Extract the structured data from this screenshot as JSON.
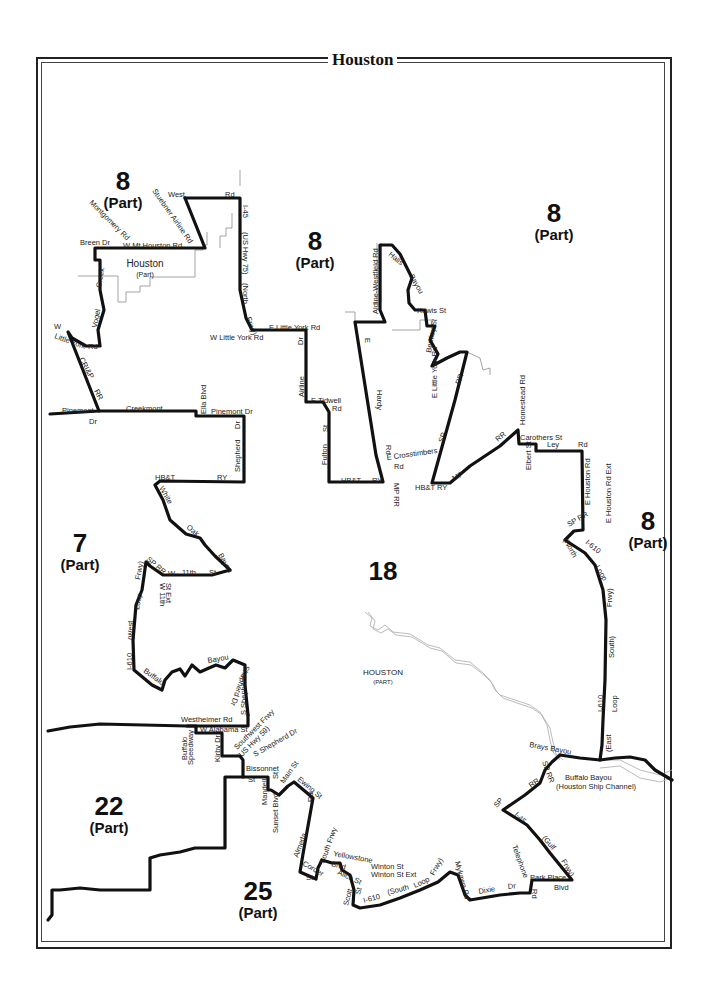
{
  "map": {
    "title": "Houston",
    "districts": [
      {
        "id": "8-nw",
        "number": "8",
        "part": "(Part)",
        "x": 123,
        "y": 190
      },
      {
        "id": "8-n",
        "number": "8",
        "part": "(Part)",
        "x": 315,
        "y": 250
      },
      {
        "id": "8-ne",
        "number": "8",
        "part": "(Part)",
        "x": 554,
        "y": 222
      },
      {
        "id": "8-e",
        "number": "8",
        "part": "(Part)",
        "x": 648,
        "y": 530
      },
      {
        "id": "7",
        "number": "7",
        "part": "(Part)",
        "x": 80,
        "y": 552
      },
      {
        "id": "18",
        "number": "18",
        "part": "",
        "x": 383,
        "y": 580
      },
      {
        "id": "22",
        "number": "22",
        "part": "(Part)",
        "x": 109,
        "y": 815
      },
      {
        "id": "25",
        "number": "25",
        "part": "(Part)",
        "x": 258,
        "y": 900
      }
    ],
    "cities": [
      {
        "id": "houston-nw",
        "name": "Houston",
        "sub": "(Part)",
        "x": 145,
        "y": 267
      },
      {
        "id": "houston-central",
        "name": "HOUSTON",
        "sub": "(PART)",
        "x": 383,
        "y": 675
      }
    ],
    "labels": [
      {
        "t": "West",
        "x": 168,
        "y": 197,
        "r": 0
      },
      {
        "t": "Rd",
        "x": 225,
        "y": 197,
        "r": 0
      },
      {
        "t": "Stuebner Airline Rd",
        "x": 152,
        "y": 191,
        "r": 55
      },
      {
        "t": "Montgomery Rd",
        "x": 89,
        "y": 203,
        "r": 45
      },
      {
        "t": "Breen Dr",
        "x": 80,
        "y": 245,
        "r": 0
      },
      {
        "t": "W Mt Houston Rd",
        "x": 123,
        "y": 248,
        "r": 0
      },
      {
        "t": "I-45",
        "x": 243,
        "y": 205,
        "r": 90
      },
      {
        "t": "(US Hwy 75)",
        "x": 243,
        "y": 232,
        "r": 90
      },
      {
        "t": "(North",
        "x": 243,
        "y": 283,
        "r": 90
      },
      {
        "t": "Frwy)",
        "x": 246,
        "y": 318,
        "r": 70
      },
      {
        "t": "Creek",
        "x": 101,
        "y": 288,
        "r": -80
      },
      {
        "t": "Vogel",
        "x": 97,
        "y": 328,
        "r": -80
      },
      {
        "t": "W",
        "x": 54,
        "y": 329,
        "r": 0
      },
      {
        "t": "Little York",
        "x": 54,
        "y": 338,
        "r": 20
      },
      {
        "t": "Rd",
        "x": 88,
        "y": 349,
        "r": 0
      },
      {
        "t": "CRI&P",
        "x": 79,
        "y": 359,
        "r": 62
      },
      {
        "t": "RR",
        "x": 94,
        "y": 391,
        "r": 62
      },
      {
        "t": "E  Little York Rd",
        "x": 269,
        "y": 330,
        "r": 0
      },
      {
        "t": "W Little York Rd",
        "x": 210,
        "y": 340,
        "r": 0
      },
      {
        "t": "Dr",
        "x": 303,
        "y": 345,
        "r": -90
      },
      {
        "t": "Airline",
        "x": 304,
        "y": 397,
        "r": -90
      },
      {
        "t": "E Tidwell",
        "x": 311,
        "y": 403,
        "r": 0
      },
      {
        "t": "Rd",
        "x": 332,
        "y": 411,
        "r": 0
      },
      {
        "t": "St",
        "x": 328,
        "y": 432,
        "r": -90
      },
      {
        "t": "Fulton",
        "x": 327,
        "y": 465,
        "r": -90
      },
      {
        "t": "Pinemont",
        "x": 62,
        "y": 413,
        "r": 0
      },
      {
        "t": "Dr",
        "x": 89,
        "y": 424,
        "r": 0
      },
      {
        "t": "Creekmont",
        "x": 126,
        "y": 411,
        "r": 0
      },
      {
        "t": "Ella Blvd",
        "x": 206,
        "y": 414,
        "r": -90
      },
      {
        "t": "Pinemont Dr",
        "x": 211,
        "y": 414,
        "r": 0
      },
      {
        "t": "Dr",
        "x": 240,
        "y": 429,
        "r": -90
      },
      {
        "t": "Shepherd",
        "x": 240,
        "y": 472,
        "r": -90
      },
      {
        "t": "HB&T",
        "x": 155,
        "y": 480,
        "r": 0
      },
      {
        "t": "RY",
        "x": 217,
        "y": 480,
        "r": 0
      },
      {
        "t": "White",
        "x": 159,
        "y": 488,
        "r": 60
      },
      {
        "t": "Oak",
        "x": 186,
        "y": 528,
        "r": 40
      },
      {
        "t": "Bayou",
        "x": 218,
        "y": 555,
        "r": 60
      },
      {
        "t": "SP RR",
        "x": 146,
        "y": 560,
        "r": 40
      },
      {
        "t": "W",
        "x": 168,
        "y": 576,
        "r": 0
      },
      {
        "t": "11th",
        "x": 182,
        "y": 575,
        "r": 0
      },
      {
        "t": "St",
        "x": 209,
        "y": 575,
        "r": 0
      },
      {
        "t": "W 11th",
        "x": 160,
        "y": 583,
        "r": 90
      },
      {
        "t": "St Ext",
        "x": 166,
        "y": 583,
        "r": 90
      },
      {
        "t": "Frwy)",
        "x": 140,
        "y": 580,
        "r": -80
      },
      {
        "t": "Loop",
        "x": 139,
        "y": 610,
        "r": -80
      },
      {
        "t": "(West",
        "x": 133,
        "y": 640,
        "r": -90
      },
      {
        "t": "I-610",
        "x": 132,
        "y": 670,
        "r": -90
      },
      {
        "t": "Buffalo",
        "x": 143,
        "y": 672,
        "r": 35
      },
      {
        "t": "Bayou",
        "x": 208,
        "y": 663,
        "r": -10
      },
      {
        "t": "Shepherd Dr",
        "x": 245,
        "y": 665,
        "r": 110
      },
      {
        "t": "S Shepherd",
        "x": 246,
        "y": 715,
        "r": -90
      },
      {
        "t": "Westheimer Rd",
        "x": 181,
        "y": 722,
        "r": 0
      },
      {
        "t": "W Alabama St",
        "x": 200,
        "y": 732,
        "r": 0
      },
      {
        "t": "Buffalo",
        "x": 187,
        "y": 760,
        "r": -90
      },
      {
        "t": "Speedway",
        "x": 193,
        "y": 765,
        "r": -90
      },
      {
        "t": "Kirby Dr",
        "x": 220,
        "y": 762,
        "r": -90
      },
      {
        "t": "Southwest Frwy",
        "x": 237,
        "y": 750,
        "r": -45
      },
      {
        "t": "(US Hwy 59)",
        "x": 240,
        "y": 759,
        "r": -45
      },
      {
        "t": "S Shepherd Dr",
        "x": 255,
        "y": 757,
        "r": -30
      },
      {
        "t": "Bissonnet",
        "x": 246,
        "y": 771,
        "r": 0
      },
      {
        "t": "St",
        "x": 248,
        "y": 782,
        "r": 0
      },
      {
        "t": "St",
        "x": 278,
        "y": 779,
        "r": -90
      },
      {
        "t": "Mandell",
        "x": 267,
        "y": 805,
        "r": -90
      },
      {
        "t": "Sunset Blvd",
        "x": 278,
        "y": 833,
        "r": -90
      },
      {
        "t": "Main St",
        "x": 284,
        "y": 784,
        "r": -55
      },
      {
        "t": "Ewing St",
        "x": 297,
        "y": 780,
        "r": 40
      },
      {
        "t": "Rd",
        "x": 313,
        "y": 802,
        "r": -90
      },
      {
        "t": "Almeda",
        "x": 298,
        "y": 858,
        "r": -70
      },
      {
        "t": "Corder",
        "x": 302,
        "y": 865,
        "r": 30
      },
      {
        "t": "St",
        "x": 306,
        "y": 880,
        "r": 0
      },
      {
        "t": "South Frwy",
        "x": 324,
        "y": 864,
        "r": -70
      },
      {
        "t": "Yellowstone",
        "x": 333,
        "y": 856,
        "r": 10
      },
      {
        "t": "Blvd",
        "x": 331,
        "y": 866,
        "r": 15
      },
      {
        "t": "Winton St",
        "x": 371,
        "y": 869,
        "r": 0
      },
      {
        "t": "Winton St Ext",
        "x": 371,
        "y": 877,
        "r": 0
      },
      {
        "t": "Alice St",
        "x": 337,
        "y": 874,
        "r": 25
      },
      {
        "t": "Scott",
        "x": 348,
        "y": 906,
        "r": -75
      },
      {
        "t": "St",
        "x": 360,
        "y": 895,
        "r": -75
      },
      {
        "t": "I-610",
        "x": 364,
        "y": 903,
        "r": -15
      },
      {
        "t": "(South",
        "x": 388,
        "y": 895,
        "r": -15
      },
      {
        "t": "Loop",
        "x": 415,
        "y": 888,
        "r": -25
      },
      {
        "t": "Frwy)",
        "x": 434,
        "y": 876,
        "r": -60
      },
      {
        "t": "Mykawa Rd",
        "x": 455,
        "y": 862,
        "r": 75
      },
      {
        "t": "Dixie",
        "x": 479,
        "y": 894,
        "r": -10
      },
      {
        "t": "Dr",
        "x": 508,
        "y": 889,
        "r": -5
      },
      {
        "t": "Telephone",
        "x": 512,
        "y": 846,
        "r": 70
      },
      {
        "t": "Rd",
        "x": 532,
        "y": 889,
        "r": 90
      },
      {
        "t": "Park Place",
        "x": 530,
        "y": 880,
        "r": 0
      },
      {
        "t": "Blvd",
        "x": 554,
        "y": 890,
        "r": 0
      },
      {
        "t": "I-45",
        "x": 514,
        "y": 815,
        "r": 45
      },
      {
        "t": "(Gulf",
        "x": 542,
        "y": 838,
        "r": 50
      },
      {
        "t": "Frwy)",
        "x": 561,
        "y": 861,
        "r": 60
      },
      {
        "t": "SP",
        "x": 497,
        "y": 808,
        "r": -50
      },
      {
        "t": "RR",
        "x": 531,
        "y": 788,
        "r": -35
      },
      {
        "t": "SP RR",
        "x": 542,
        "y": 762,
        "r": 70
      },
      {
        "t": "Brays Bayou",
        "x": 529,
        "y": 747,
        "r": 10
      },
      {
        "t": "Buffalo Bayou",
        "x": 565,
        "y": 780,
        "r": 0
      },
      {
        "t": "(Houston Ship Channel)",
        "x": 556,
        "y": 789,
        "r": 0
      },
      {
        "t": "(East",
        "x": 611,
        "y": 752,
        "r": -90
      },
      {
        "t": "Loop",
        "x": 617,
        "y": 712,
        "r": -90
      },
      {
        "t": "I-610",
        "x": 603,
        "y": 712,
        "r": -90
      },
      {
        "t": "South)",
        "x": 614,
        "y": 658,
        "r": -90
      },
      {
        "t": "Frwy)",
        "x": 612,
        "y": 607,
        "r": -90
      },
      {
        "t": "Loop",
        "x": 595,
        "y": 567,
        "r": 60
      },
      {
        "t": "(North",
        "x": 563,
        "y": 540,
        "r": 60
      },
      {
        "t": "I-610",
        "x": 585,
        "y": 543,
        "r": 40
      },
      {
        "t": "SP RR",
        "x": 569,
        "y": 527,
        "r": -30
      },
      {
        "t": "E Houston Rd",
        "x": 590,
        "y": 505,
        "r": -90
      },
      {
        "t": "E Houston Rd Ext",
        "x": 611,
        "y": 523,
        "r": -90
      },
      {
        "t": "Carothers St",
        "x": 520,
        "y": 440,
        "r": 0
      },
      {
        "t": "Ley",
        "x": 547,
        "y": 447,
        "r": 0
      },
      {
        "t": "Rd",
        "x": 578,
        "y": 447,
        "r": 0
      },
      {
        "t": "Elbert St",
        "x": 531,
        "y": 470,
        "r": -90
      },
      {
        "t": "Homestead Rd",
        "x": 525,
        "y": 425,
        "r": -90
      },
      {
        "t": "RR",
        "x": 498,
        "y": 442,
        "r": -40
      },
      {
        "t": "SP",
        "x": 443,
        "y": 443,
        "r": -70
      },
      {
        "t": "RR",
        "x": 460,
        "y": 385,
        "r": -70
      },
      {
        "t": "MP",
        "x": 454,
        "y": 481,
        "r": -30
      },
      {
        "t": "HB&T RY",
        "x": 415,
        "y": 490,
        "r": 0
      },
      {
        "t": "HB&T",
        "x": 341,
        "y": 483,
        "r": 0
      },
      {
        "t": "RY",
        "x": 372,
        "y": 483,
        "r": 0
      },
      {
        "t": "MP RR",
        "x": 394,
        "y": 483,
        "r": 90
      },
      {
        "t": "E Crosstimbers",
        "x": 387,
        "y": 460,
        "r": -8
      },
      {
        "t": "Rd",
        "x": 394,
        "y": 469,
        "r": 0
      },
      {
        "t": "Rd",
        "x": 386,
        "y": 445,
        "r": 90
      },
      {
        "t": "Hardy",
        "x": 377,
        "y": 390,
        "r": 90
      },
      {
        "t": "E",
        "x": 365,
        "y": 338,
        "r": 90
      },
      {
        "t": "Aldine-Westfield Rd",
        "x": 378,
        "y": 314,
        "r": -90
      },
      {
        "t": "Halls",
        "x": 388,
        "y": 255,
        "r": 40
      },
      {
        "t": "Bayou",
        "x": 409,
        "y": 276,
        "r": 60
      },
      {
        "t": "Kowis St",
        "x": 417,
        "y": 313,
        "r": 0
      },
      {
        "t": "Bentley St",
        "x": 431,
        "y": 353,
        "r": -80
      },
      {
        "t": "E Little York Rd",
        "x": 437,
        "y": 398,
        "r": -90
      }
    ]
  }
}
